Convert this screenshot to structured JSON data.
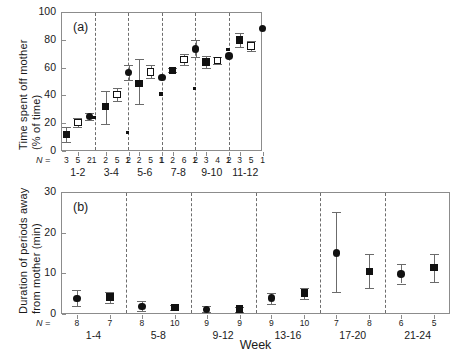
{
  "figure": {
    "xlabel": "Week",
    "n_prefix": "N ="
  },
  "chart_data": [
    {
      "type": "scatter",
      "panel": "(a)",
      "title": "",
      "xlabel": "",
      "ylabel": "Time spent off mother (% of time)",
      "ylabel_line1": "Time spent off mother",
      "ylabel_line2": "(% of time)",
      "ylim": [
        0,
        100
      ],
      "yticks": [
        0,
        20,
        40,
        60,
        80,
        100
      ],
      "grid": false,
      "legend": "none",
      "groups": [
        "1-2",
        "3-4",
        "5-6",
        "7-8",
        "9-10",
        "11-12"
      ],
      "n_values": [
        [
          "3",
          "5",
          "2"
        ],
        [
          "1",
          "2",
          "5",
          "2"
        ],
        [
          "1",
          "2",
          "5",
          "1"
        ],
        [
          "1",
          "2",
          "6",
          "2"
        ],
        [
          "1",
          "3",
          "4",
          "2"
        ],
        [
          "1",
          "3",
          "5",
          "1"
        ]
      ],
      "series": [
        {
          "name": "small dot",
          "marker": "dot",
          "points": [
            {
              "group": "3-4",
              "slot": 0,
              "y": 24
            },
            {
              "group": "5-6",
              "slot": 0,
              "y": 13.5
            },
            {
              "group": "7-8",
              "slot": 0,
              "y": 41
            },
            {
              "group": "9-10",
              "slot": 0,
              "y": 45
            },
            {
              "group": "11-12",
              "slot": 0,
              "y": 73
            }
          ]
        },
        {
          "name": "filled square",
          "marker": "filled-square",
          "points": [
            {
              "group": "1-2",
              "slot": 0,
              "y": 12,
              "err_low": 5.5,
              "err_high": 5.5
            },
            {
              "group": "3-4",
              "slot": 1,
              "y": 32,
              "err_low": 12.5,
              "err_high": 11
            },
            {
              "group": "5-6",
              "slot": 1,
              "y": 48.5,
              "err_low": 14.5,
              "err_high": 18
            },
            {
              "group": "7-8",
              "slot": 1,
              "y": 58,
              "err_low": 1.5,
              "err_high": 1.5
            },
            {
              "group": "9-10",
              "slot": 1,
              "y": 64,
              "err_low": 4,
              "err_high": 4
            },
            {
              "group": "11-12",
              "slot": 1,
              "y": 80,
              "err_low": 5,
              "err_high": 5
            }
          ]
        },
        {
          "name": "open square",
          "marker": "open-square",
          "points": [
            {
              "group": "1-2",
              "slot": 1,
              "y": 20.5,
              "err_low": 3,
              "err_high": 3.5
            },
            {
              "group": "3-4",
              "slot": 2,
              "y": 40.5,
              "err_low": 4.5,
              "err_high": 5
            },
            {
              "group": "5-6",
              "slot": 2,
              "y": 57,
              "err_low": 4.5,
              "err_high": 5
            },
            {
              "group": "7-8",
              "slot": 2,
              "y": 66,
              "err_low": 4,
              "err_high": 4
            },
            {
              "group": "9-10",
              "slot": 2,
              "y": 65,
              "err_low": 2.5,
              "err_high": 2.5
            },
            {
              "group": "11-12",
              "slot": 2,
              "y": 75.5,
              "err_low": 3.5,
              "err_high": 3.5
            }
          ]
        },
        {
          "name": "filled circle",
          "marker": "filled-circle",
          "points": [
            {
              "group": "1-2",
              "slot": 2,
              "y": 25,
              "err_low": 2.5,
              "err_high": 2.5
            },
            {
              "group": "3-4",
              "slot": 3,
              "y": 56.5,
              "err_low": 5.5,
              "err_high": 5.5
            },
            {
              "group": "5-6",
              "slot": 3,
              "y": 53
            },
            {
              "group": "7-8",
              "slot": 3,
              "y": 73.5,
              "err_low": 6,
              "err_high": 6
            },
            {
              "group": "9-10",
              "slot": 3,
              "y": 68.5
            },
            {
              "group": "11-12",
              "slot": 3,
              "y": 88
            }
          ]
        }
      ]
    },
    {
      "type": "scatter",
      "panel": "(b)",
      "title": "",
      "xlabel": "Week",
      "ylabel": "Duration of periods away from mother (min)",
      "ylabel_line1": "Duration of periods away",
      "ylabel_line2": "from mother (min)",
      "ylim": [
        0,
        30
      ],
      "yticks": [
        0,
        10,
        20,
        30
      ],
      "grid": false,
      "legend": "none",
      "groups": [
        "1-4",
        "5-8",
        "9-12",
        "13-16",
        "17-20",
        "21-24"
      ],
      "n_values": [
        [
          "8",
          "7"
        ],
        [
          "8",
          "10"
        ],
        [
          "9",
          "9"
        ],
        [
          "9",
          "10"
        ],
        [
          "7",
          "8"
        ],
        [
          "6",
          "5"
        ]
      ],
      "series": [
        {
          "name": "filled circle",
          "marker": "filled-circle",
          "points": [
            {
              "group": "1-4",
              "slot": 0,
              "y": 3.8,
              "err_low": 1.8,
              "err_high": 2.2
            },
            {
              "group": "5-8",
              "slot": 0,
              "y": 1.9,
              "err_low": 1.1,
              "err_high": 1.2
            },
            {
              "group": "9-12",
              "slot": 0,
              "y": 1.1,
              "err_low": 0.7,
              "err_high": 0.8
            },
            {
              "group": "13-16",
              "slot": 0,
              "y": 3.9,
              "err_low": 1.4,
              "err_high": 1.3
            },
            {
              "group": "17-20",
              "slot": 0,
              "y": 15,
              "err_low": 9.5,
              "err_high": 10
            },
            {
              "group": "21-24",
              "slot": 0,
              "y": 9.8,
              "err_low": 2.3,
              "err_high": 2.4
            }
          ]
        },
        {
          "name": "filled square",
          "marker": "filled-square",
          "points": [
            {
              "group": "1-4",
              "slot": 1,
              "y": 4.2,
              "err_low": 1.4,
              "err_high": 1.3
            },
            {
              "group": "5-8",
              "slot": 1,
              "y": 1.6,
              "err_low": 0.7,
              "err_high": 0.7
            },
            {
              "group": "9-12",
              "slot": 1,
              "y": 1.2,
              "err_low": 0.6,
              "err_high": 0.6
            },
            {
              "group": "13-16",
              "slot": 1,
              "y": 5.2,
              "err_low": 1.6,
              "err_high": 1.2
            },
            {
              "group": "17-20",
              "slot": 1,
              "y": 10.5,
              "err_low": 4,
              "err_high": 4.2
            },
            {
              "group": "21-24",
              "slot": 1,
              "y": 11.4,
              "err_low": 3.5,
              "err_high": 3.3
            }
          ]
        }
      ]
    }
  ]
}
